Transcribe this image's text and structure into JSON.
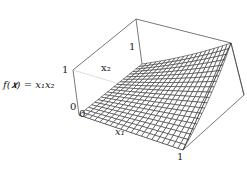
{
  "chart_data": {
    "type": "surface3d",
    "title": "",
    "function_label": "f(x) = x1 x2",
    "xlabel": "x1",
    "ylabel": "x2",
    "zlabel": "f(x) = x1 x2",
    "x_range": [
      0,
      1
    ],
    "y_range": [
      0,
      1
    ],
    "z_range": [
      0,
      1
    ],
    "grid_divisions": 20,
    "tick_labels": {
      "x1": [
        "0",
        "1"
      ],
      "x2": [
        "0",
        "1"
      ],
      "z": [
        "0",
        "1"
      ]
    },
    "surface": "z = x1 * x2",
    "sample_points": [
      {
        "x1": 0,
        "x2": 0,
        "z": 0
      },
      {
        "x1": 1,
        "x2": 0,
        "z": 0
      },
      {
        "x1": 0,
        "x2": 1,
        "z": 0
      },
      {
        "x1": 1,
        "x2": 1,
        "z": 1
      },
      {
        "x1": 0.5,
        "x2": 0.5,
        "z": 0.25
      }
    ],
    "line_color": "#333333",
    "box": true
  },
  "labels": {
    "func": "f(𝒙) = x₁x₂",
    "x1": "x₁",
    "x2": "x₂",
    "z0": "0",
    "z1": "1",
    "x1_0": "0",
    "x1_1": "1",
    "x2_1": "1"
  }
}
